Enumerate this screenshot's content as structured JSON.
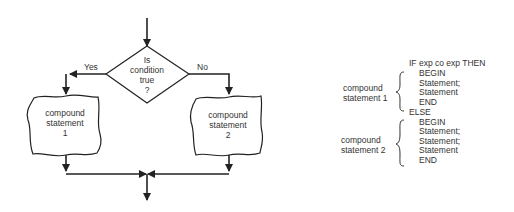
{
  "flowchart": {
    "decision": {
      "lines": [
        "Is",
        "condition",
        "true",
        "?"
      ]
    },
    "yes_label": "Yes",
    "no_label": "No",
    "left_block": {
      "lines": [
        "compound",
        "statement",
        "1"
      ]
    },
    "right_block": {
      "lines": [
        "compound",
        "statement",
        "2"
      ]
    }
  },
  "code": {
    "if_line": "IF exp co exp THEN",
    "block1": [
      "BEGIN",
      "Statement;",
      "Statement",
      "END"
    ],
    "else_line": "ELSE",
    "block2": [
      "BEGIN",
      "Statement;",
      "Statement;",
      "Statement",
      "END"
    ],
    "label1": "compound statement 1",
    "label2": "compound statement 2"
  },
  "colors": {
    "stroke": "#222222",
    "text": "#333333"
  }
}
